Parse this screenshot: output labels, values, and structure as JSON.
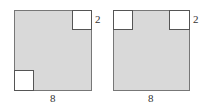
{
  "figures": [
    {
      "name": "left",
      "side_label": "8",
      "corner_label": "2",
      "cutouts": [
        "top-right",
        "bottom-left"
      ]
    },
    {
      "name": "right",
      "side_label": "8",
      "corner_label": "2",
      "cutouts": [
        "top-left",
        "top-right"
      ]
    }
  ],
  "colors": {
    "shaded": "#d9d9d9",
    "border": "#777777",
    "cutout": "#ffffff"
  }
}
